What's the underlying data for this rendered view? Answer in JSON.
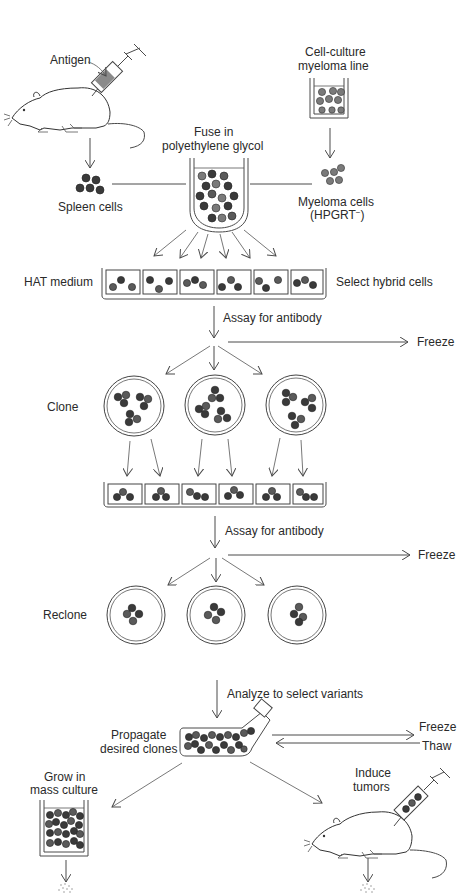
{
  "labels": {
    "antigen": "Antigen",
    "cell_culture_line1": "Cell-culture",
    "cell_culture_line2": "myeloma line",
    "fuse_line1": "Fuse in",
    "fuse_line2": "polyethylene glycol",
    "spleen_cells": "Spleen cells",
    "myeloma_line1": "Myeloma cells",
    "myeloma_line2": "(HPGRT",
    "myeloma_superscript": "−",
    "myeloma_close": ")",
    "hat_medium": "HAT medium",
    "select_hybrid": "Select hybrid cells",
    "assay1": "Assay for antibody",
    "freeze1": "Freeze",
    "clone": "Clone",
    "assay2": "Assay for antibody",
    "freeze2": "Freeze",
    "reclone": "Reclone",
    "analyze": "Analyze to select variants",
    "propagate_line1": "Propagate",
    "propagate_line2": "desired clones",
    "freeze3": "Freeze",
    "thaw": "Thaw",
    "grow_line1": "Grow in",
    "grow_line2": "mass culture",
    "induce_line1": "Induce",
    "induce_line2": "tumors"
  },
  "stages": [
    {
      "id": "immunize",
      "icon": "mouse-with-syringe-icon"
    },
    {
      "id": "myeloma-culture",
      "icon": "culture-dish-icon"
    },
    {
      "id": "fusion",
      "icon": "test-tube-icon"
    },
    {
      "id": "hat-selection",
      "wells": 6,
      "icon": "multiwell-plate-icon"
    },
    {
      "id": "clone",
      "dishes": 3,
      "icon": "petri-dish-icon"
    },
    {
      "id": "subculture",
      "wells": 6,
      "icon": "multiwell-plate-icon"
    },
    {
      "id": "reclone",
      "dishes": 3,
      "icon": "petri-dish-icon"
    },
    {
      "id": "propagate",
      "icon": "culture-flask-icon"
    },
    {
      "id": "mass-culture",
      "icon": "culture-beaker-icon"
    },
    {
      "id": "induce-tumors",
      "icon": "mouse-with-syringe-icon"
    }
  ],
  "colors": {
    "line": "#4a4a4a",
    "cell_dark": "#3a3a3a",
    "cell_grey": "#7a7a7a",
    "syringe_fill": "#8a8a8a",
    "background": "#ffffff"
  }
}
